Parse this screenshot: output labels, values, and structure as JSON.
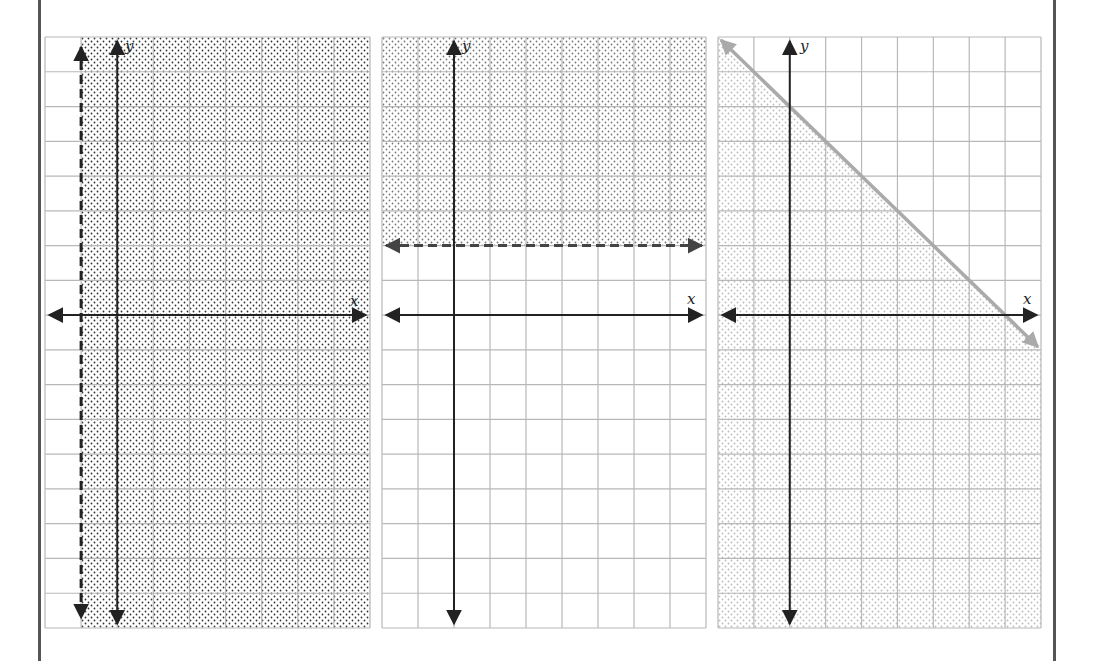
{
  "chart_data": [
    {
      "type": "inequality_graph",
      "title": "",
      "xlabel": "x",
      "ylabel": "y",
      "xlim": [
        -2,
        7
      ],
      "ylim": [
        -9,
        8
      ],
      "grid": true,
      "boundary": {
        "kind": "vertical",
        "equation": "x = -1",
        "x": -1,
        "style": "dashed",
        "color": "#222222"
      },
      "inequality": "x > -1",
      "shaded_region": "right of boundary",
      "shade_color": "#333333"
    },
    {
      "type": "inequality_graph",
      "title": "",
      "xlabel": "x",
      "ylabel": "y",
      "xlim": [
        -2,
        7
      ],
      "ylim": [
        -9,
        8
      ],
      "grid": true,
      "boundary": {
        "kind": "horizontal",
        "equation": "y = 2",
        "y": 2,
        "style": "dashed",
        "color": "#444444"
      },
      "inequality": "y > 2",
      "shaded_region": "above boundary",
      "shade_color": "#777777"
    },
    {
      "type": "inequality_graph",
      "title": "",
      "xlabel": "x",
      "ylabel": "y",
      "xlim": [
        -2,
        7
      ],
      "ylim": [
        -9,
        8
      ],
      "grid": true,
      "boundary": {
        "kind": "line",
        "equation": "y = -x + 6",
        "slope": -1,
        "intercept": 6,
        "points": [
          [
            -2,
            8
          ],
          [
            7,
            -1
          ]
        ],
        "style": "solid",
        "color": "#aaaaaa"
      },
      "inequality": "y <= -x + 6",
      "shaded_region": "below boundary",
      "shade_color": "#bbbbbb"
    }
  ],
  "graphs": [
    {
      "x_label": "x",
      "y_label": "y"
    },
    {
      "x_label": "x",
      "y_label": "y"
    },
    {
      "x_label": "x",
      "y_label": "y"
    }
  ],
  "colors": {
    "border": "#555555",
    "grid": "#b8b8b8",
    "axis": "#222222"
  }
}
